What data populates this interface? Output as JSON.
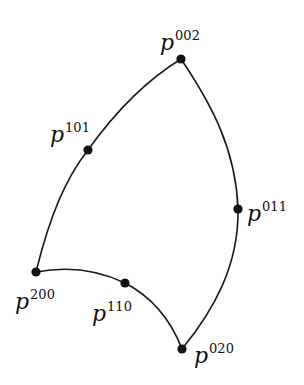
{
  "diagram": {
    "type": "triangular-bezier-patch-boundary",
    "control_points": [
      {
        "id": "p002",
        "base": "p",
        "superscript": "002",
        "x": 181,
        "y": 59
      },
      {
        "id": "p101",
        "base": "p",
        "superscript": "101",
        "x": 88,
        "y": 150
      },
      {
        "id": "p011",
        "base": "p",
        "superscript": "011",
        "x": 238,
        "y": 209
      },
      {
        "id": "p200",
        "base": "p",
        "superscript": "200",
        "x": 36,
        "y": 272
      },
      {
        "id": "p110",
        "base": "p",
        "superscript": "110",
        "x": 125,
        "y": 283
      },
      {
        "id": "p020",
        "base": "p",
        "superscript": "020",
        "x": 182,
        "y": 349
      }
    ],
    "edges": [
      {
        "from": "p200",
        "via": "p101",
        "to": "p002"
      },
      {
        "from": "p002",
        "via": "p011",
        "to": "p020"
      },
      {
        "from": "p200",
        "via": "p110",
        "to": "p020"
      }
    ],
    "colors": {
      "line": "#1a1a1a",
      "point": "#111111",
      "background": "#ffffff"
    }
  },
  "labels": {
    "p002": {
      "base": "p",
      "sup": "002"
    },
    "p101": {
      "base": "p",
      "sup": "101"
    },
    "p011": {
      "base": "p",
      "sup": "011"
    },
    "p200": {
      "base": "p",
      "sup": "200"
    },
    "p110": {
      "base": "p",
      "sup": "110"
    },
    "p020": {
      "base": "p",
      "sup": "020"
    }
  }
}
